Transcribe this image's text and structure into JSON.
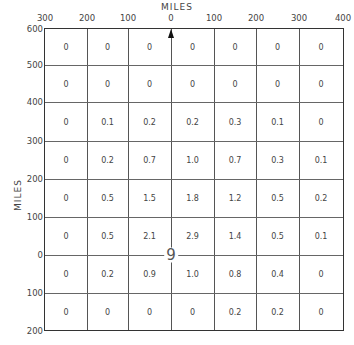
{
  "chart_data": {
    "type": "heatmap",
    "title": "",
    "xlabel": "MILES",
    "ylabel": "MILES",
    "x_tick_labels": [
      "300",
      "200",
      "100",
      "0",
      "100",
      "200",
      "300",
      "400"
    ],
    "y_tick_labels": [
      "600",
      "500",
      "400",
      "300",
      "200",
      "100",
      "0",
      "100",
      "200"
    ],
    "x_range_miles": [
      -300,
      400
    ],
    "y_range_miles": [
      -200,
      600
    ],
    "grid": true,
    "legend": null,
    "center_symbol": "9",
    "north_arrow": true,
    "rows_top_to_bottom": [
      [
        "0",
        "0",
        "0",
        "0",
        "0",
        "0",
        "0"
      ],
      [
        "0",
        "0",
        "0",
        "0",
        "0",
        "0",
        "0"
      ],
      [
        "0",
        "0.1",
        "0.2",
        "0.2",
        "0.3",
        "0.1",
        "0"
      ],
      [
        "0",
        "0.2",
        "0.7",
        "1.0",
        "0.7",
        "0.3",
        "0.1"
      ],
      [
        "0",
        "0.5",
        "1.5",
        "1.8",
        "1.2",
        "0.5",
        "0.2"
      ],
      [
        "0",
        "0.5",
        "2.1",
        "2.9",
        "1.4",
        "0.5",
        "0.1"
      ],
      [
        "0",
        "0.2",
        "0.9",
        "1.0",
        "0.8",
        "0.4",
        "0"
      ],
      [
        "0",
        "0",
        "0",
        "0",
        "0.2",
        "0.2",
        "0"
      ]
    ]
  }
}
